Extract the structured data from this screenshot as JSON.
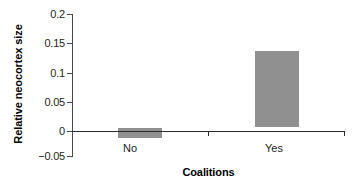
{
  "chart_data": {
    "type": "bar",
    "title": "",
    "xlabel": "Coalitions",
    "ylabel": "Relative neocortex size",
    "categories": [
      "No",
      "Yes"
    ],
    "values": [
      -0.018,
      0.134
    ],
    "ylim": [
      -0.05,
      0.2
    ],
    "ytick_labels": [
      "0.2",
      "0.15",
      "0.1",
      "0.05",
      "0",
      "−0.05"
    ],
    "ytick_values": [
      0.2,
      0.15,
      0.1,
      0.05,
      0,
      -0.05
    ],
    "grid": false,
    "legend": false,
    "bar_color": "#909090",
    "axis_color": "#2b2b2b"
  },
  "axes": {
    "y_labels": {
      "t0": "0.2",
      "t1": "0.15",
      "t2": "0.1",
      "t3": "0.05",
      "t4": "0",
      "t5": "−0.05"
    },
    "y_title": "Relative neocortex size",
    "x_labels": {
      "c0": "No",
      "c1": "Yes"
    },
    "x_title": "Coalitions"
  }
}
